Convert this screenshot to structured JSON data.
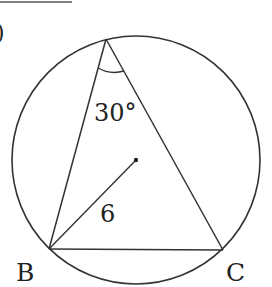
{
  "diagram": {
    "type": "inscribed-triangle-in-circle",
    "circle": {
      "cx": 136,
      "cy": 160,
      "r": 124,
      "center_marked": true
    },
    "vertices": {
      "A": {
        "x": 106,
        "y": 39,
        "label": ""
      },
      "B": {
        "x": 49,
        "y": 249,
        "label": "B"
      },
      "C": {
        "x": 223,
        "y": 250,
        "label": "C"
      }
    },
    "angle_label": "30°",
    "radius_label": "6",
    "colors": {
      "stroke": "#333333",
      "text": "#222222",
      "background": "#ffffff"
    }
  },
  "labels": {
    "B": "B",
    "C": "C",
    "angle": "30°",
    "radius": "6",
    "partial_paren": ")"
  }
}
